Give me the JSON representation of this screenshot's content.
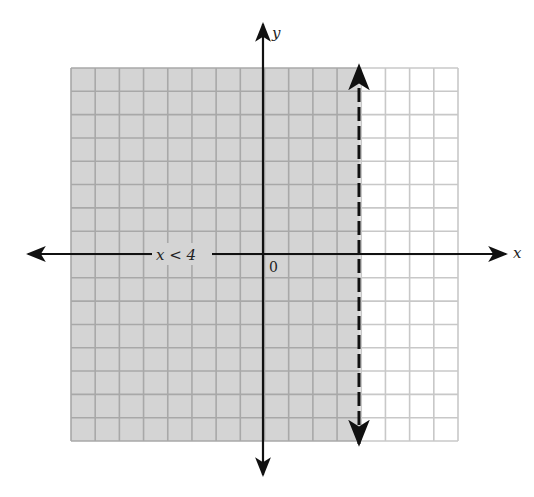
{
  "chart_data": {
    "type": "inequality-graph",
    "title": "",
    "inequality": "x < 4",
    "boundary": {
      "x": 4,
      "style": "dashed",
      "included": false
    },
    "shaded_region": "x < 4",
    "xlabel": "x",
    "ylabel": "y",
    "origin_label": "0",
    "xlim": [
      -8,
      8
    ],
    "ylim": [
      -8,
      8
    ],
    "grid": true,
    "grid_step": 1,
    "colors": {
      "shade": "#d4d4d4",
      "grid_line": "#a8a8a8",
      "grid_line_unshaded": "#c8c8c8",
      "axis": "#111111"
    }
  },
  "labels": {
    "x_axis": "x",
    "y_axis": "y",
    "origin": "0",
    "inequality": "x < 4"
  }
}
